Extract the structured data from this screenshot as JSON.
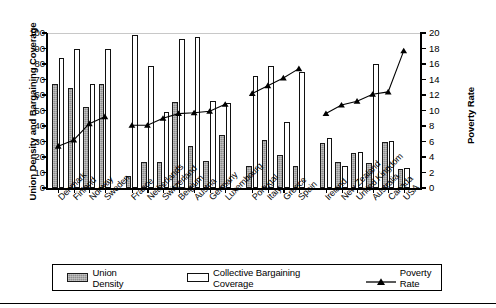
{
  "axes": {
    "y_left_title": "Union Density and Bargaining Coverage",
    "y_right_title": "Poverty Rate",
    "y_left_ticks": [
      "100",
      "90",
      "80",
      "70",
      "60",
      "50",
      "40",
      "30",
      "20",
      "10",
      "0"
    ],
    "y_right_ticks": [
      "20",
      "18",
      "16",
      "14",
      "12",
      "10",
      "8",
      "6",
      "4",
      "2",
      "0"
    ]
  },
  "legend": {
    "union_label": "Union Density",
    "cbc_label": "Collective Bargaining Coverage",
    "poverty_label": "Poverty Rate"
  },
  "chart_data": {
    "type": "bar",
    "title": "",
    "xlabel": "",
    "ylabel": "Union Density and Bargaining Coverage",
    "ylabel_right": "Poverty Rate",
    "ylim": [
      0,
      100
    ],
    "ylim_right": [
      0,
      20
    ],
    "grid": false,
    "legend_position": "bottom",
    "categories": [
      "Denmark",
      "Finland",
      "Norway",
      "Sweden",
      "France",
      "Netherlands",
      "Switzerland",
      "Belgium",
      "Austria",
      "Germany",
      "Luxembourg",
      "Portugal",
      "Italy",
      "Greece",
      "Spain",
      "Ireland",
      "New Zealand",
      "United Kingdom",
      "Australia",
      "Canada",
      "USA"
    ],
    "group_breaks": [
      4,
      11,
      15
    ],
    "series": [
      {
        "name": "Union Density",
        "axis": "left",
        "values": [
          67,
          64.5,
          52.5,
          67,
          8,
          17,
          16.5,
          55.5,
          27,
          17.5,
          34,
          14.5,
          31,
          21,
          14.5,
          29,
          17,
          22.5,
          16,
          29.5,
          12
        ]
      },
      {
        "name": "Collective Bargaining Coverage",
        "axis": "left",
        "values": [
          84,
          89.5,
          67,
          90,
          98.5,
          78.5,
          49,
          96,
          97.5,
          56,
          55,
          72,
          79,
          42.5,
          75,
          32,
          14,
          23.5,
          80,
          30.5,
          13
        ]
      },
      {
        "name": "Poverty Rate",
        "axis": "right",
        "values": [
          5.4,
          6.2,
          8.3,
          9.2,
          8.1,
          8.1,
          9.0,
          9.6,
          9.7,
          9.9,
          10.8,
          12.2,
          13.2,
          14.2,
          15.4,
          9.6,
          10.7,
          11.2,
          12.1,
          12.4,
          17.7
        ]
      }
    ]
  }
}
